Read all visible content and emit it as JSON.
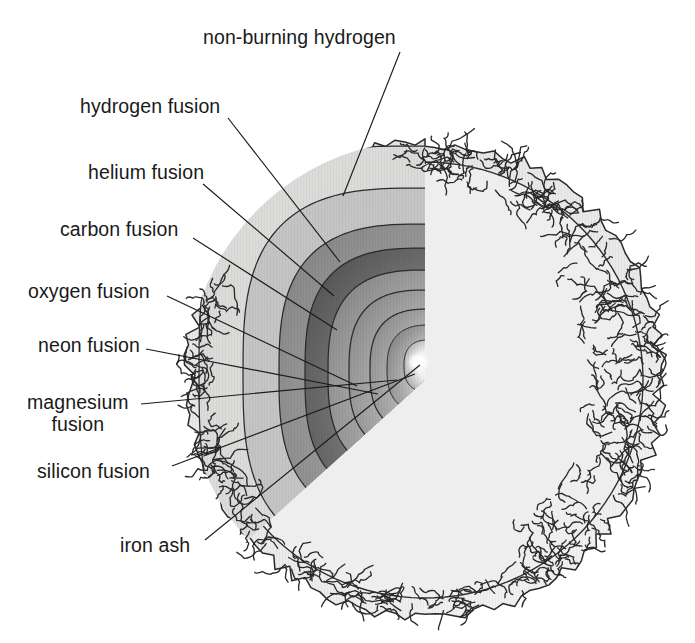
{
  "figure": {
    "type": "cutaway-cross-section-diagram",
    "background_color": "#ffffff",
    "ink_color": "#1a1a1a"
  },
  "star": {
    "center_x": 425,
    "center_y": 380,
    "radius": 236,
    "envelope_fill": "#e9e9e9",
    "envelope_edge": "ragged-convective-boundary",
    "cut_wedge": "upper-left-front quarter removed",
    "core_highlight_color": "#ffffff",
    "core_x": 418,
    "core_y": 362
  },
  "shells": [
    {
      "id": "non-burning-hydrogen",
      "label": "non-burning hydrogen",
      "order": 1,
      "fill_outer": "#e3e3e3",
      "fill_inner": "#d2d2d2",
      "radius": 232
    },
    {
      "id": "hydrogen-fusion",
      "label": "hydrogen fusion",
      "order": 2,
      "fill_outer": "#c6c6c6",
      "fill_inner": "#b4b4b4",
      "radius": 186
    },
    {
      "id": "helium-fusion",
      "label": "helium fusion",
      "order": 3,
      "fill_outer": "#7a7a7a",
      "fill_inner": "#9e9e9e",
      "radius": 150
    },
    {
      "id": "carbon-fusion",
      "label": "carbon fusion",
      "order": 4,
      "fill_outer": "#4f4f4f",
      "fill_inner": "#8c8c8c",
      "radius": 126
    },
    {
      "id": "oxygen-fusion",
      "label": "oxygen fusion",
      "order": 5,
      "fill_outer": "#8d8d8d",
      "fill_inner": "#c8c8c8",
      "radius": 103
    },
    {
      "id": "neon-fusion",
      "label": "neon fusion",
      "order": 6,
      "fill_outer": "#909090",
      "fill_inner": "#cfcfcf",
      "radius": 82
    },
    {
      "id": "magnesium-fusion",
      "label": "magnesium fusion",
      "order": 7,
      "fill_outer": "#8a8a8a",
      "fill_inner": "#d2d2d2",
      "radius": 62
    },
    {
      "id": "silicon-fusion",
      "label": "silicon fusion",
      "order": 8,
      "fill_outer": "#7e7e7e",
      "fill_inner": "#d6d6d6",
      "radius": 44
    },
    {
      "id": "iron-ash",
      "label": "iron ash",
      "order": 9,
      "fill_outer": "#8a8a8a",
      "fill_inner": "#ffffff",
      "radius": 26
    }
  ],
  "labels": [
    {
      "id": "non-burning-hydrogen",
      "text": "non-burning hydrogen",
      "x": 203,
      "y": 27,
      "align": "left",
      "lines": [
        "non-burning hydrogen"
      ],
      "leader": {
        "x1": 400,
        "y1": 52,
        "x2": 343,
        "y2": 196
      }
    },
    {
      "id": "hydrogen-fusion",
      "text": "hydrogen fusion",
      "x": 80,
      "y": 96,
      "align": "left",
      "lines": [
        "hydrogen fusion"
      ],
      "leader": {
        "x1": 228,
        "y1": 118,
        "x2": 340,
        "y2": 262
      }
    },
    {
      "id": "helium-fusion",
      "text": "helium fusion",
      "x": 88,
      "y": 162,
      "align": "left",
      "lines": [
        "helium fusion"
      ],
      "leader": {
        "x1": 203,
        "y1": 184,
        "x2": 334,
        "y2": 296
      }
    },
    {
      "id": "carbon-fusion",
      "text": "carbon fusion",
      "x": 60,
      "y": 219,
      "align": "left",
      "lines": [
        "carbon fusion"
      ],
      "leader": {
        "x1": 193,
        "y1": 238,
        "x2": 337,
        "y2": 330
      }
    },
    {
      "id": "oxygen-fusion",
      "text": "oxygen fusion",
      "x": 28,
      "y": 281,
      "align": "left",
      "lines": [
        "oxygen fusion"
      ],
      "leader": {
        "x1": 167,
        "y1": 296,
        "x2": 357,
        "y2": 386
      }
    },
    {
      "id": "neon-fusion",
      "text": "neon fusion",
      "x": 38,
      "y": 335,
      "align": "left",
      "lines": [
        "neon fusion"
      ],
      "leader": {
        "x1": 146,
        "y1": 349,
        "x2": 378,
        "y2": 394
      }
    },
    {
      "id": "magnesium-fusion",
      "text": "magnesium fusion",
      "x": 27,
      "y": 392,
      "align": "left",
      "lines": [
        "magnesium",
        "fusion"
      ],
      "leader": {
        "x1": 141,
        "y1": 404,
        "x2": 397,
        "y2": 380
      }
    },
    {
      "id": "silicon-fusion",
      "text": "silicon fusion",
      "x": 37,
      "y": 461,
      "align": "left",
      "lines": [
        "silicon fusion"
      ],
      "leader": {
        "x1": 172,
        "y1": 466,
        "x2": 415,
        "y2": 374
      }
    },
    {
      "id": "iron-ash",
      "text": "iron ash",
      "x": 120,
      "y": 535,
      "align": "left",
      "lines": [
        "iron ash"
      ],
      "leader": {
        "x1": 205,
        "y1": 540,
        "x2": 420,
        "y2": 365
      }
    }
  ]
}
